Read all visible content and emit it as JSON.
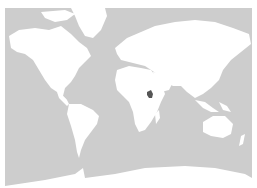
{
  "map": {
    "projection": "mercator-world",
    "ocean_color": "#cdcdcd",
    "land_color": "#ffffff",
    "highlight_color": "#555555",
    "highlighted_region": "East Africa (Uganda/Kenya area)"
  }
}
